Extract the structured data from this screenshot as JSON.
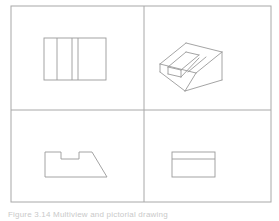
{
  "figure": {
    "caption": "Figure 3.14  Multiview and pictorial drawing",
    "background_color": "#ffffff",
    "line_color": "#9a9a9a",
    "border_color": "#a8a8a8",
    "divider_color": "#a8a8a8",
    "stroke_width": 0.9,
    "width": 279,
    "height": 221
  },
  "frame": {
    "name": "outer-border",
    "x": 11,
    "y": 6,
    "width": 260,
    "height": 196
  },
  "dividers": {
    "vertical_x": 144,
    "horizontal_y": 110
  },
  "quadrants": [
    {
      "id": "top-left",
      "label": "Top view",
      "type": "orthographic",
      "description": "Rectangle subdivided by internal vertical lines"
    },
    {
      "id": "top-right",
      "label": "Pictorial view",
      "type": "isometric",
      "description": "Isometric pictorial of the machined block with channel and chamfer"
    },
    {
      "id": "bottom-left",
      "label": "Front view",
      "type": "orthographic",
      "description": "Profile with rectangular notch at top and angled chamfer at right"
    },
    {
      "id": "bottom-right",
      "label": "Right side view",
      "type": "orthographic",
      "description": "Rectangle divided by one horizontal line near the top"
    }
  ],
  "geometry": {
    "top_view": {
      "rect": {
        "x": 44,
        "y": 38,
        "width": 62,
        "height": 42
      },
      "vertical_lines_x": [
        57,
        72,
        78
      ]
    },
    "front_view": {
      "points": "45,177 45,152 61,152 61,159 79,159 79,152 92,152 107,177",
      "closed": true
    },
    "side_view": {
      "rect": {
        "x": 172,
        "y": 152,
        "width": 43,
        "height": 25
      },
      "horizontal_line_y": 159
    },
    "pictorial": {
      "top_face": "160,64 186,43 222,52 196,73",
      "base_outline": "160,64 160,72 185,91 222,80 222,52",
      "channel_left": "168,67 186,52 199,55 181,70",
      "channel_inner": "168,67 168,74 181,77 181,70",
      "chamfer": "196,73 222,52 222,80 185,91",
      "ridge": "181,70 199,55 206,57 188,72",
      "edges": [
        "160,64 186,43",
        "186,43 222,52",
        "222,52 196,73",
        "196,73 160,64",
        "160,64 160,72",
        "160,72 185,91",
        "185,91 222,80",
        "222,80 222,52",
        "168,67 186,52",
        "186,52 199,55",
        "199,55 181,70",
        "181,70 168,67",
        "168,67 168,74",
        "168,74 181,77",
        "181,77 181,70",
        "181,77 199,58",
        "185,91 196,73",
        "206,57 188,72"
      ]
    }
  }
}
